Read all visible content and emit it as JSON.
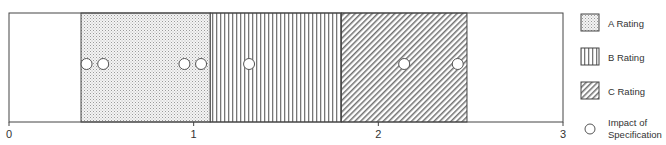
{
  "chart_data": {
    "type": "scatter",
    "title": "",
    "xlabel": "",
    "ylabel": "",
    "xlim": [
      0,
      3
    ],
    "x_ticks": [
      0,
      1,
      2,
      3
    ],
    "x_tick_labels": [
      "0",
      "1",
      "2",
      "3"
    ],
    "grid": false,
    "bands": [
      {
        "name": "A Rating",
        "start": 0.39,
        "end": 1.09,
        "pattern": "dots"
      },
      {
        "name": "B Rating",
        "start": 1.09,
        "end": 1.8,
        "pattern": "vertical-lines"
      },
      {
        "name": "C Rating",
        "start": 1.8,
        "end": 2.48,
        "pattern": "diagonal-lines"
      }
    ],
    "series": [
      {
        "name": "Impact of Specification",
        "marker": "open-circle",
        "x": [
          0.42,
          0.51,
          0.95,
          1.04,
          1.3,
          2.14,
          2.43
        ]
      }
    ],
    "legend": {
      "placement": "right",
      "entries": [
        {
          "label": "A Rating",
          "swatch": "dots"
        },
        {
          "label": "B Rating",
          "swatch": "vertical-lines"
        },
        {
          "label": "C Rating",
          "swatch": "diagonal-lines"
        },
        {
          "label": "Impact of",
          "label2": "Specification",
          "swatch": "open-circle"
        }
      ]
    }
  }
}
